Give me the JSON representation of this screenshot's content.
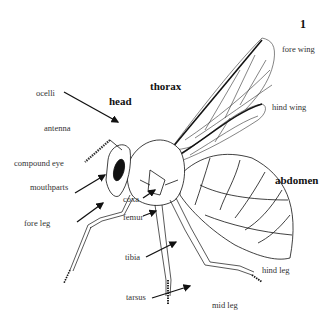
{
  "figure": {
    "number": "1",
    "regions": {
      "head": "head",
      "thorax": "thorax",
      "abdomen": "abdomen"
    },
    "labels": {
      "ocelli": "ocelli",
      "antenna": "antenna",
      "compound_eye": "compound eye",
      "mouthparts": "mouthparts",
      "fore_leg": "fore leg",
      "coxa": "coxa",
      "femur": "femur",
      "tibia": "tibia",
      "tarsus": "tarsus",
      "mid_leg": "mid leg",
      "hind_leg": "hind leg",
      "fore_wing": "fore wing",
      "hind_wing": "hind wing"
    },
    "colors": {
      "line": "#111111",
      "text": "#333333",
      "background": "#ffffff"
    }
  }
}
